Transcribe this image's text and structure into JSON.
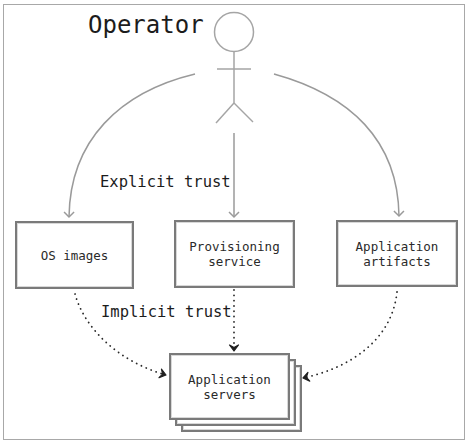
{
  "diagram": {
    "title": "Operator",
    "actor": {
      "name": "operator-stick-figure",
      "icon": "stick-figure-icon"
    },
    "edge_labels": {
      "explicit": "Explicit trust",
      "implicit": "Implicit trust"
    },
    "nodes": [
      {
        "id": "os_images",
        "lines": [
          "OS images"
        ]
      },
      {
        "id": "provisioning_service",
        "lines": [
          "Provisioning",
          "service"
        ]
      },
      {
        "id": "application_artifacts",
        "lines": [
          "Application",
          "artifacts"
        ]
      },
      {
        "id": "application_servers",
        "lines": [
          "Application",
          "servers"
        ],
        "stacked": 3
      }
    ],
    "edges": [
      {
        "from": "Operator",
        "to": "OS images",
        "style": "solid",
        "label": "Explicit trust"
      },
      {
        "from": "Operator",
        "to": "Provisioning service",
        "style": "solid",
        "label": "Explicit trust"
      },
      {
        "from": "Operator",
        "to": "Application artifacts",
        "style": "solid",
        "label": "Explicit trust"
      },
      {
        "from": "OS images",
        "to": "Application servers",
        "style": "dotted",
        "label": "Implicit trust"
      },
      {
        "from": "Provisioning service",
        "to": "Application servers",
        "style": "dotted",
        "label": "Implicit trust"
      },
      {
        "from": "Application artifacts",
        "to": "Application servers",
        "style": "dotted",
        "label": "Implicit trust"
      }
    ],
    "colors": {
      "frame": "#a8a8a8",
      "solid_arrow": "#9a9a9a",
      "dotted_arrow": "#2a2a2a",
      "box_border": "#7a7a7a",
      "text": "#1c1c1c"
    }
  }
}
